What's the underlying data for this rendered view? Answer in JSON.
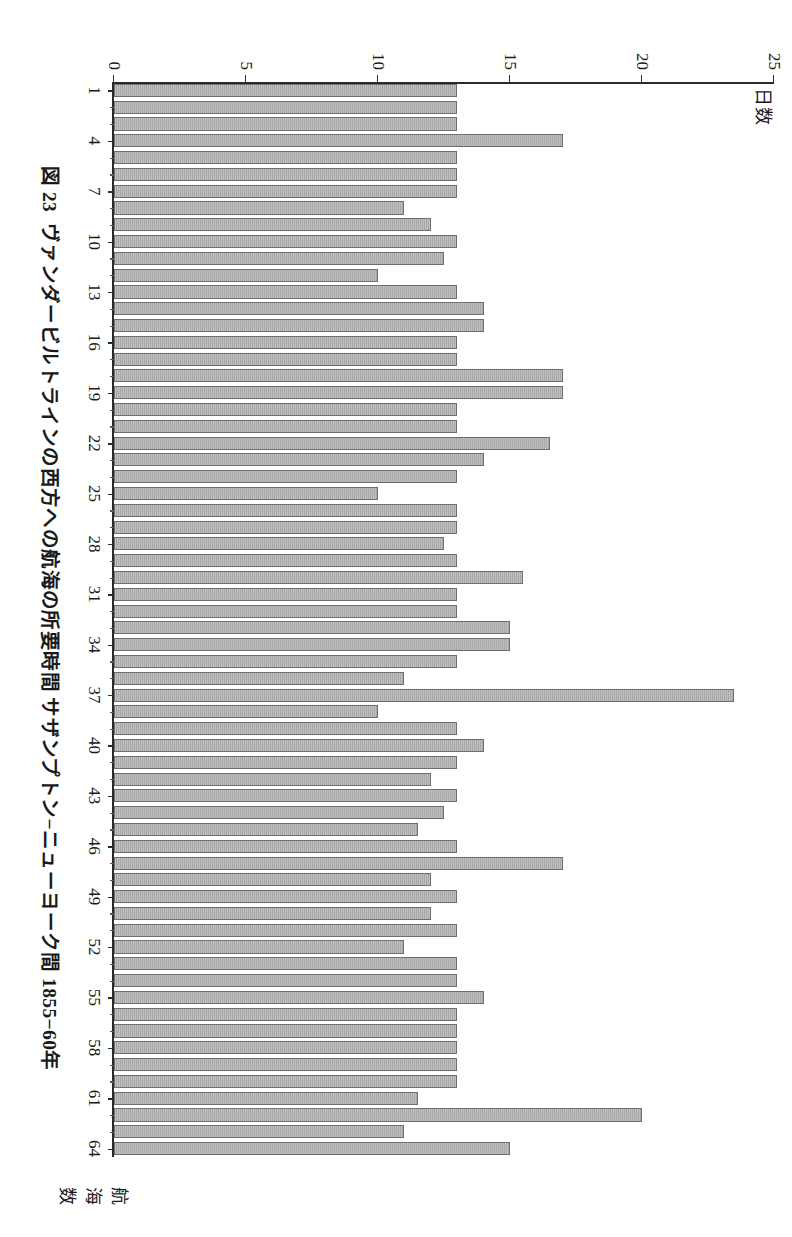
{
  "figure": {
    "number": "図 23",
    "title": "ヴァンダービルトラインの西方への航海の所要時間 サザンプトン−ニューヨーク間 1855−60年"
  },
  "axes": {
    "value_axis_label": "日数",
    "category_axis_label": "航海数",
    "value_ticks": [
      "0",
      "5",
      "10",
      "15",
      "20",
      "25"
    ],
    "category_ticks": [
      "1",
      "4",
      "7",
      "10",
      "13",
      "16",
      "19",
      "22",
      "25",
      "28",
      "31",
      "34",
      "37",
      "40",
      "43",
      "46",
      "49",
      "52",
      "55",
      "58",
      "61",
      "64"
    ]
  },
  "style": {
    "bar_fill": "#a8a8a8",
    "bar_stroke": "#6f6f6f",
    "axis_color": "#2a2a2a",
    "background": "#ffffff"
  },
  "chart_data": {
    "type": "bar",
    "orientation": "horizontal",
    "xlabel": "航海数",
    "ylabel": "日数",
    "ylim": [
      0,
      25
    ],
    "grid": false,
    "legend": "none",
    "categories": [
      1,
      2,
      3,
      4,
      5,
      6,
      7,
      8,
      9,
      10,
      11,
      12,
      13,
      14,
      15,
      16,
      17,
      18,
      19,
      20,
      21,
      22,
      23,
      24,
      25,
      26,
      27,
      28,
      29,
      30,
      31,
      32,
      33,
      34,
      35,
      36,
      37,
      38,
      39,
      40,
      41,
      42,
      43,
      44,
      45,
      46,
      47,
      48,
      49,
      50,
      51,
      52,
      53,
      54,
      55,
      56,
      57,
      58,
      59,
      60,
      61,
      62,
      63,
      64
    ],
    "values": [
      13,
      13,
      13,
      17,
      13,
      13,
      13,
      11,
      12,
      13,
      12.5,
      10,
      13,
      14,
      14,
      13,
      13,
      17,
      17,
      13,
      13,
      16.5,
      14,
      13,
      10,
      13,
      13,
      12.5,
      13,
      15.5,
      13,
      13,
      15,
      15,
      13,
      11,
      23.5,
      10,
      13,
      14,
      13,
      12,
      13,
      12.5,
      11.5,
      13,
      17,
      12,
      13,
      12,
      13,
      11,
      13,
      13,
      14,
      13,
      13,
      13,
      13,
      13,
      11.5,
      20,
      11,
      15
    ]
  }
}
